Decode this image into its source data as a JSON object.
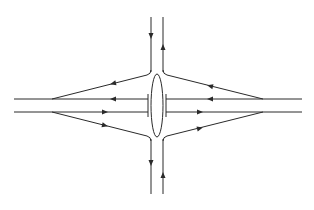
{
  "diagram": {
    "type": "interchange",
    "colors": {
      "line": "#2a2a2a",
      "background": "#ffffff"
    },
    "horizontal_road": {
      "upper_lane": {
        "y": 99,
        "x_start": 14,
        "x_end": 302,
        "direction": "west"
      },
      "lower_lane": {
        "y": 112,
        "x_start": 14,
        "x_end": 302,
        "direction": "east"
      },
      "stop_bars": [
        {
          "x": 148,
          "y1": 94,
          "y2": 117
        },
        {
          "x": 166,
          "y1": 94,
          "y2": 117
        }
      ]
    },
    "vertical_road": {
      "left_lane": {
        "x": 151,
        "direction": "south"
      },
      "right_lane": {
        "x": 163,
        "direction": "north"
      },
      "y_top": 17,
      "y_bottom": 194
    },
    "central_island": {
      "shape": "ellipse",
      "cx": 157,
      "cy": 105.5,
      "rx": 6,
      "ry": 31.5
    },
    "ramps": [
      {
        "name": "upper-left-ramp",
        "from": [
          151,
          74
        ],
        "to": [
          52,
          99
        ],
        "direction": "toward-west"
      },
      {
        "name": "upper-right-ramp",
        "from": [
          263,
          99
        ],
        "to": [
          163,
          74
        ],
        "direction": "toward-center"
      },
      {
        "name": "lower-left-ramp",
        "from": [
          52,
          112
        ],
        "to": [
          151,
          137
        ],
        "direction": "toward-center"
      },
      {
        "name": "lower-right-ramp",
        "from": [
          163,
          137
        ],
        "to": [
          263,
          112
        ],
        "direction": "toward-east"
      }
    ],
    "arrows": [
      {
        "x": 151,
        "y": 36,
        "dir": "down"
      },
      {
        "x": 163,
        "y": 47,
        "dir": "up"
      },
      {
        "x": 151,
        "y": 163,
        "dir": "down"
      },
      {
        "x": 163,
        "y": 175,
        "dir": "up"
      },
      {
        "x": 113,
        "y": 83,
        "dir": "left",
        "angle": -14
      },
      {
        "x": 113,
        "y": 99,
        "dir": "left"
      },
      {
        "x": 105,
        "y": 112,
        "dir": "right"
      },
      {
        "x": 105,
        "y": 125,
        "dir": "right",
        "angle": 14
      },
      {
        "x": 210,
        "y": 86,
        "dir": "left",
        "angle": 14
      },
      {
        "x": 210,
        "y": 99,
        "dir": "left"
      },
      {
        "x": 200,
        "y": 112,
        "dir": "right"
      },
      {
        "x": 200,
        "y": 128,
        "dir": "right",
        "angle": -14
      }
    ]
  }
}
